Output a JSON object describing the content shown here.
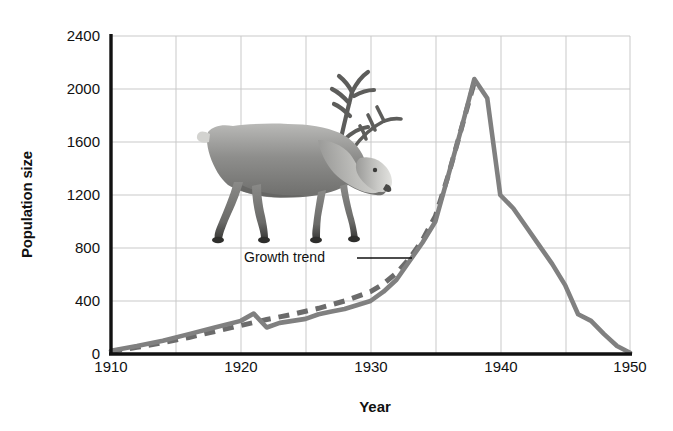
{
  "chart_data": {
    "type": "line",
    "title": "",
    "xlabel": "Year",
    "ylabel": "Population size",
    "xlim": [
      1910,
      1950
    ],
    "ylim": [
      0,
      2400
    ],
    "xticks": [
      "1910",
      "1920",
      "1930",
      "1940",
      "1950"
    ],
    "yticks": [
      "0",
      "400",
      "800",
      "1200",
      "1600",
      "2000",
      "2400"
    ],
    "grid": true,
    "legend_position": "inline-annotation",
    "annotations": [
      {
        "text": "Growth trend",
        "target_series": "Growth trend"
      }
    ],
    "image_caption": "reindeer-photograph",
    "series": [
      {
        "name": "Population size",
        "style": "solid",
        "color": "#808080",
        "x": [
          1910,
          1912,
          1914,
          1916,
          1918,
          1920,
          1921,
          1922,
          1923,
          1924,
          1925,
          1926,
          1927,
          1928,
          1929,
          1930,
          1931,
          1932,
          1933,
          1934,
          1935,
          1936,
          1937,
          1938,
          1939,
          1940,
          1941,
          1942,
          1943,
          1944,
          1945,
          1946,
          1947,
          1948,
          1949,
          1950
        ],
        "y": [
          25,
          60,
          100,
          150,
          200,
          250,
          305,
          200,
          235,
          250,
          265,
          300,
          320,
          340,
          370,
          400,
          470,
          560,
          700,
          840,
          1000,
          1350,
          1700,
          2075,
          1930,
          1200,
          1100,
          960,
          820,
          680,
          520,
          300,
          250,
          150,
          60,
          10
        ]
      },
      {
        "name": "Growth trend",
        "style": "dashed",
        "color": "#6b6b6b",
        "x": [
          1910,
          1912,
          1914,
          1916,
          1918,
          1920,
          1922,
          1924,
          1926,
          1928,
          1930,
          1931,
          1932,
          1933,
          1934,
          1935,
          1936,
          1937,
          1938
        ],
        "y": [
          20,
          50,
          85,
          125,
          170,
          215,
          260,
          300,
          345,
          400,
          470,
          530,
          610,
          720,
          860,
          1040,
          1350,
          1700,
          2050
        ]
      }
    ]
  },
  "axis": {
    "y_title": "Population size",
    "x_title": "Year",
    "y_ticks": [
      "2400",
      "2000",
      "1600",
      "1200",
      "800",
      "400",
      "0"
    ],
    "x_ticks": [
      "1910",
      "1920",
      "1930",
      "1940",
      "1950"
    ]
  },
  "annotation": {
    "growth_trend_label": "Growth trend"
  },
  "colors": {
    "series_line": "#808080",
    "trend_line": "#6b6b6b",
    "grid": "#c9c9c9",
    "axis": "#111111",
    "text": "#111111",
    "background": "#ffffff"
  }
}
